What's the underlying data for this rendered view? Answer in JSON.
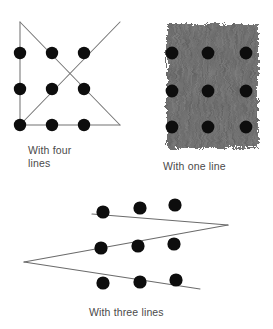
{
  "figure": {
    "type": "nine-dot-puzzle-solutions",
    "background_color": "#ffffff",
    "dot_color": "#0d0d0d",
    "line_color": "#737373",
    "brush_color": "#585858"
  },
  "puzzles": [
    {
      "id": "four-lines",
      "caption": "With four\nlines",
      "line_count": 4,
      "dot_grid": {
        "rows": 3,
        "cols": 3,
        "radius": 6.2,
        "points": [
          {
            "x": 20,
            "y": 53
          },
          {
            "x": 52,
            "y": 53
          },
          {
            "x": 84,
            "y": 53
          },
          {
            "x": 20,
            "y": 89
          },
          {
            "x": 52,
            "y": 89
          },
          {
            "x": 84,
            "y": 89
          },
          {
            "x": 20,
            "y": 125
          },
          {
            "x": 52,
            "y": 125
          },
          {
            "x": 84,
            "y": 125
          }
        ]
      },
      "paths": [
        {
          "name": "vertical-left-line",
          "points": [
            [
              20,
              22
            ],
            [
              20,
              125
            ]
          ]
        },
        {
          "name": "diagonal-down-right-line",
          "points": [
            [
              20,
              22
            ],
            [
              120,
              125
            ]
          ]
        },
        {
          "name": "horizontal-bottom-line",
          "points": [
            [
              20,
              125
            ],
            [
              120,
              125
            ]
          ]
        },
        {
          "name": "diagonal-up-right-line",
          "points": [
            [
              20,
              125
            ],
            [
              120,
              22
            ]
          ]
        }
      ]
    },
    {
      "id": "one-line",
      "caption": "With one line",
      "line_count": 1,
      "dot_grid": {
        "rows": 3,
        "cols": 3,
        "radius": 6.4,
        "points": [
          {
            "x": 32,
            "y": 53
          },
          {
            "x": 68,
            "y": 53
          },
          {
            "x": 106,
            "y": 53
          },
          {
            "x": 32,
            "y": 91
          },
          {
            "x": 68,
            "y": 91
          },
          {
            "x": 106,
            "y": 91
          },
          {
            "x": 32,
            "y": 127
          },
          {
            "x": 68,
            "y": 127
          },
          {
            "x": 106,
            "y": 127
          }
        ]
      },
      "brush_stroke": {
        "name": "thick-brush-stroke",
        "x": 27,
        "y": 24,
        "width": 91,
        "height": 124
      }
    },
    {
      "id": "three-lines",
      "caption": "With three lines",
      "line_count": 3,
      "dot_grid": {
        "rows": 3,
        "cols": 3,
        "radius": 6.6,
        "points": [
          {
            "x": 103,
            "y": 26
          },
          {
            "x": 140,
            "y": 22
          },
          {
            "x": 175,
            "y": 19
          },
          {
            "x": 101,
            "y": 62
          },
          {
            "x": 138,
            "y": 60
          },
          {
            "x": 174,
            "y": 58
          },
          {
            "x": 103,
            "y": 97
          },
          {
            "x": 140,
            "y": 96
          },
          {
            "x": 176,
            "y": 94
          }
        ]
      },
      "paths": [
        {
          "name": "zigzag-top-line",
          "points": [
            [
              92,
              28
            ],
            [
              228,
              39
            ]
          ]
        },
        {
          "name": "zigzag-middle-line",
          "points": [
            [
              228,
              39
            ],
            [
              24,
              76
            ]
          ]
        },
        {
          "name": "zigzag-bottom-line",
          "points": [
            [
              24,
              76
            ],
            [
              200,
              103
            ]
          ]
        }
      ]
    }
  ]
}
